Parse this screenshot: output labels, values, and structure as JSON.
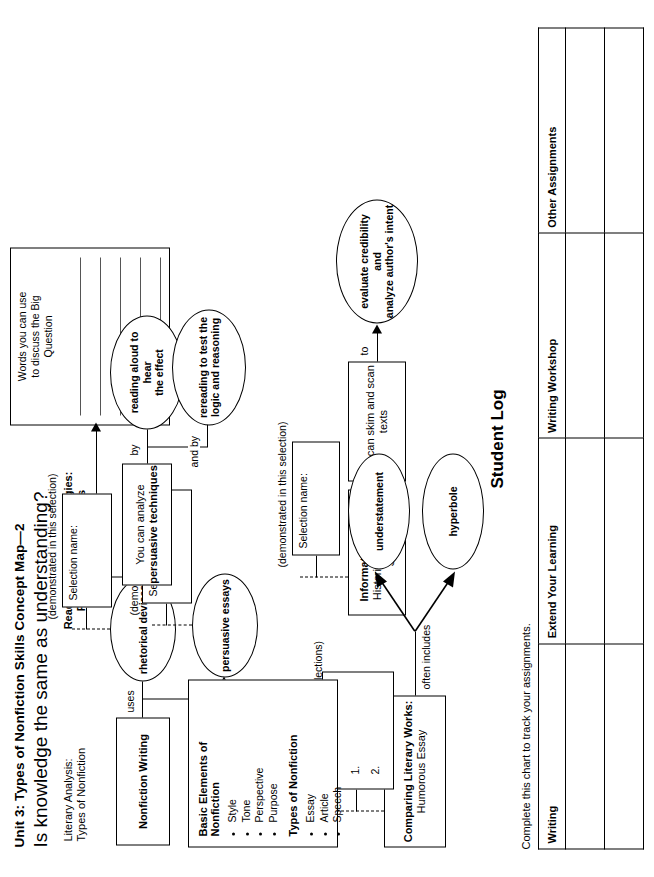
{
  "header": {
    "unit_title": "Unit 3: Types of Nonfiction   Skills Concept Map—2",
    "big_question": "Is knowledge the same as understanding?"
  },
  "sections": {
    "literary_analysis": {
      "line1": "Literary Analysis:",
      "line2": "Types of Nonfiction"
    },
    "reading_skills": {
      "line1": "Reading Skills and Strategies:",
      "line2": "Persuasive Techniques"
    }
  },
  "word_bank": {
    "title_line1": "Words you can use",
    "title_line2": "to discuss the Big",
    "title_line3": "Question",
    "line_count": 6
  },
  "nodes": {
    "nonfiction_writing": {
      "label": "Nonfiction Writing"
    },
    "rhetorical_devices": {
      "label": "rhetorical devices"
    },
    "persuasive_essays": {
      "label": "persuasive essays"
    },
    "analyze_techniques": {
      "line1": "You can analyze",
      "line2": "persuasive techniques"
    },
    "reading_aloud": {
      "line1": "reading aloud to hear",
      "line2": "the effect"
    },
    "rereading": {
      "line1": "rereading to test the",
      "line2": "logic and reasoning"
    },
    "informational_text": {
      "line1": "Informational Text:",
      "line2": "Historical Research Study"
    },
    "skim_scan": {
      "label": "You can skim and scan texts"
    },
    "evaluate_credibility": {
      "line1": "evaluate credibility and",
      "line2": "analyze author's intent"
    },
    "comparing_works": {
      "line1": "Comparing Literary Works:",
      "line2": "Humorous Essay"
    },
    "understatement": {
      "label": "understatement"
    },
    "hyperbole": {
      "label": "hyperbole"
    }
  },
  "connectors": {
    "uses": "uses",
    "and_includes": "and includes",
    "by": "by",
    "and_by": "and by",
    "to": "to",
    "often_includes": "often includes"
  },
  "selection_notes": {
    "rhetorical": {
      "caption": "(demonstrated in this selection)",
      "field_label": "Selection name:"
    },
    "persuasive": {
      "caption": "(demonstrated in this selection)",
      "field_label": "Selection name:"
    },
    "informational": {
      "caption": "(demonstrated in this selection)",
      "field_label": "Selection name:"
    },
    "comparing": {
      "caption": "(demonstrated in these selections)",
      "field_label": "Selection names:",
      "items": [
        "1.",
        "2."
      ]
    }
  },
  "elements_card": {
    "heading1": "Basic Elements of Nonfiction",
    "bullets1": [
      "Style",
      "Tone",
      "Perspective",
      "Purpose"
    ],
    "heading2": "Types of Nonfiction",
    "bullets2": [
      "Essay",
      "Article",
      "Speech"
    ]
  },
  "student_log": {
    "title": "Student Log",
    "intro": "Complete this chart to track your assignments.",
    "columns": [
      "Writing",
      "Extend Your Learning",
      "Writing Workshop",
      "Other Assignments"
    ],
    "rows": [
      [
        "",
        "",
        "",
        ""
      ],
      [
        "",
        "",
        "",
        ""
      ]
    ]
  },
  "colors": {
    "ink": "#000000",
    "paper": "#ffffff",
    "rule": "#555555"
  }
}
